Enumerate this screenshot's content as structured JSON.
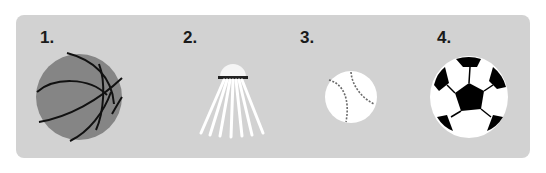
{
  "panel": {
    "background": "#d2d2d2"
  },
  "items": [
    {
      "label": "1.",
      "icon": "basketball-icon",
      "color": "#858585"
    },
    {
      "label": "2.",
      "icon": "shuttlecock-icon",
      "color": "#ffffff"
    },
    {
      "label": "3.",
      "icon": "baseball-icon",
      "color": "#ffffff"
    },
    {
      "label": "4.",
      "icon": "soccer-ball-icon",
      "color": "#000000"
    }
  ]
}
